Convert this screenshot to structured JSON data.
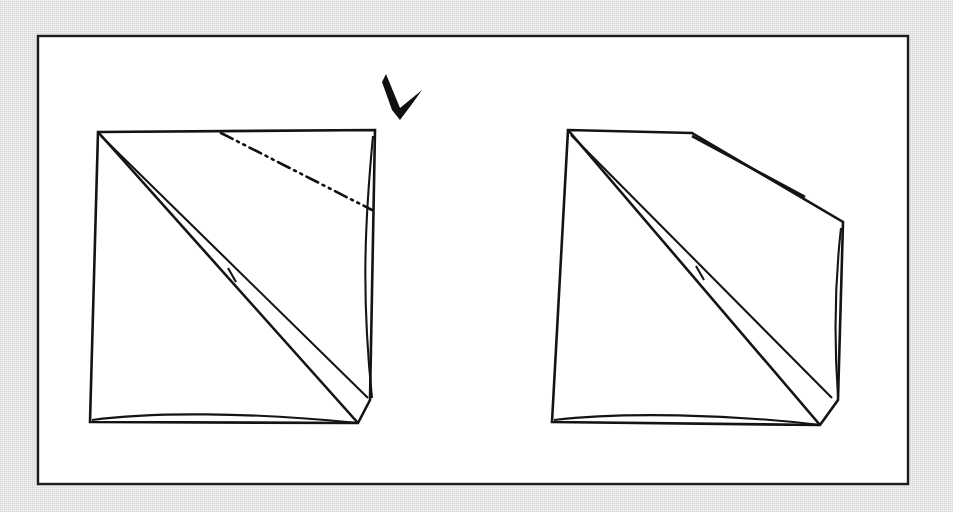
{
  "document": {
    "kind": "origami-instruction-diagram",
    "caption": "",
    "background_color": "#f2f2f2",
    "ink_color": "#141414",
    "paper_color": "#ffffff",
    "frame_border_color": "#1c1c1c"
  },
  "frame": {
    "name": "diagram-frame",
    "x": 38,
    "y": 36,
    "width": 870,
    "height": 448
  },
  "panels": [
    {
      "id": "left",
      "name": "step-before-fold",
      "label": "",
      "has_fold_line": true,
      "has_arrow": true,
      "fold_line_style": "dash-dot-dot",
      "fold_line_meaning": "valley-fold-crease"
    },
    {
      "id": "right",
      "name": "step-after-fold",
      "label": "",
      "has_fold_line": false,
      "has_arrow": false,
      "flap_state": "folded-down"
    }
  ],
  "annotations": {
    "arrow": {
      "name": "fold-direction-arrow",
      "style": "solid-black-arrowhead",
      "direction": "down-left",
      "points_to": "top-right-flap"
    },
    "tick_marks": [
      {
        "name": "crease-tick-left",
        "panel": "left"
      },
      {
        "name": "crease-tick-right",
        "panel": "right"
      }
    ]
  },
  "geometry": {
    "left_panel": {
      "outline": "98,132 375,130 370,400 358,423 90,422",
      "top_edge": "98,132 375,130",
      "left_edge": "98,132 90,422",
      "bottom_edge": "90,422 358,423",
      "bottom_edge_inner": "92,420 200,415 300,419 358,423",
      "right_flap_outer": "375,130 370,400",
      "right_flap_inner": "373,136 362,270 372,398",
      "diagonal_outer": "98,132 358,423",
      "diagonal_inner": "101,136 368,398",
      "sliver_top": "98,132 230,276",
      "sliver_bottom": "103,138 232,272",
      "crease_tick": "228,268 236,282",
      "fold_line": "221,133 372,210"
    },
    "right_panel": {
      "outline": "568,130 692,133 843,222 838,400 820,425 552,422",
      "top_edge": "568,130 692,133",
      "left_edge": "568,130 552,422",
      "bottom_edge": "552,422 820,425",
      "bottom_edge_inner": "554,420 660,414 760,419 820,425",
      "flap_upper": "692,133 808,178",
      "flap_cap": "808,178 805,197",
      "flap_lower": "692,136 805,197",
      "right_upper_edge": "805,197 843,222",
      "right_edge": "843,222 838,400",
      "right_bottom": "838,400 820,425",
      "diagonal_outer": "568,130 820,425",
      "diagonal_inner": "571,135 832,398",
      "sliver_top": "568,130 698,272",
      "sliver_bottom": "573,136 700,268",
      "crease_tick": "696,266 704,280"
    },
    "arrow": {
      "polygon": "386,74 400,108 422,90 412,104 400,120 392,110 382,82"
    }
  }
}
